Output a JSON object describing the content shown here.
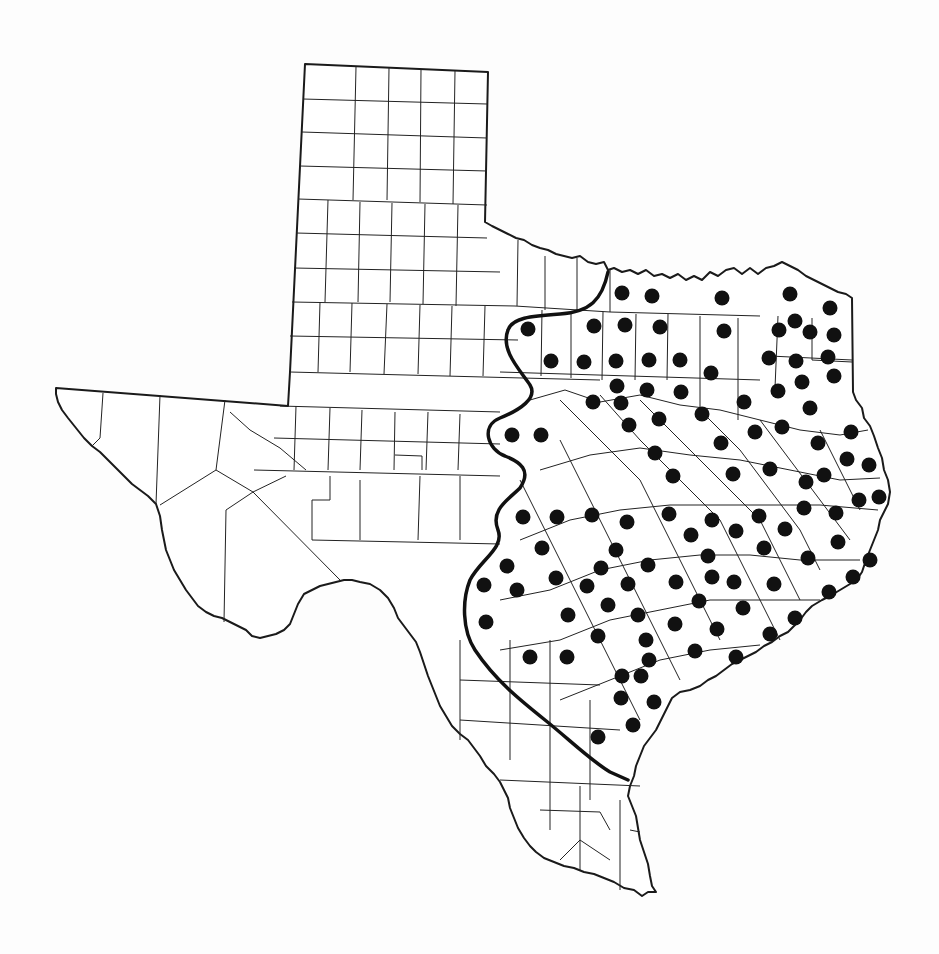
{
  "map": {
    "region": "Texas",
    "description": "County outline map of Texas with species occurrence dots and a range boundary line",
    "colors": {
      "background": "#ffffff",
      "outline": "#1a1a1a",
      "dot": "#111111",
      "boundary": "#111111"
    },
    "dot_radius": 7.5,
    "dots": [
      [
        622,
        293
      ],
      [
        652,
        296
      ],
      [
        722,
        298
      ],
      [
        790,
        294
      ],
      [
        830,
        308
      ],
      [
        528,
        329
      ],
      [
        594,
        326
      ],
      [
        625,
        325
      ],
      [
        660,
        327
      ],
      [
        724,
        331
      ],
      [
        779,
        330
      ],
      [
        795,
        321
      ],
      [
        810,
        332
      ],
      [
        834,
        335
      ],
      [
        551,
        361
      ],
      [
        584,
        362
      ],
      [
        616,
        361
      ],
      [
        649,
        360
      ],
      [
        680,
        360
      ],
      [
        711,
        373
      ],
      [
        769,
        358
      ],
      [
        796,
        361
      ],
      [
        828,
        357
      ],
      [
        834,
        376
      ],
      [
        617,
        386
      ],
      [
        647,
        390
      ],
      [
        681,
        392
      ],
      [
        593,
        402
      ],
      [
        621,
        403
      ],
      [
        744,
        402
      ],
      [
        778,
        391
      ],
      [
        802,
        382
      ],
      [
        810,
        408
      ],
      [
        512,
        435
      ],
      [
        541,
        435
      ],
      [
        629,
        425
      ],
      [
        659,
        419
      ],
      [
        702,
        414
      ],
      [
        755,
        432
      ],
      [
        782,
        427
      ],
      [
        818,
        443
      ],
      [
        851,
        432
      ],
      [
        655,
        453
      ],
      [
        721,
        443
      ],
      [
        770,
        469
      ],
      [
        847,
        459
      ],
      [
        869,
        465
      ],
      [
        673,
        476
      ],
      [
        733,
        474
      ],
      [
        806,
        482
      ],
      [
        824,
        475
      ],
      [
        859,
        500
      ],
      [
        879,
        497
      ],
      [
        523,
        517
      ],
      [
        557,
        517
      ],
      [
        592,
        515
      ],
      [
        627,
        522
      ],
      [
        669,
        514
      ],
      [
        712,
        520
      ],
      [
        736,
        531
      ],
      [
        759,
        516
      ],
      [
        785,
        529
      ],
      [
        804,
        508
      ],
      [
        836,
        513
      ],
      [
        542,
        548
      ],
      [
        616,
        550
      ],
      [
        648,
        565
      ],
      [
        691,
        535
      ],
      [
        708,
        556
      ],
      [
        764,
        548
      ],
      [
        808,
        558
      ],
      [
        838,
        542
      ],
      [
        507,
        566
      ],
      [
        484,
        585
      ],
      [
        517,
        590
      ],
      [
        556,
        578
      ],
      [
        587,
        586
      ],
      [
        601,
        568
      ],
      [
        628,
        584
      ],
      [
        676,
        582
      ],
      [
        712,
        577
      ],
      [
        734,
        582
      ],
      [
        774,
        584
      ],
      [
        829,
        592
      ],
      [
        853,
        577
      ],
      [
        870,
        560
      ],
      [
        486,
        622
      ],
      [
        568,
        615
      ],
      [
        608,
        605
      ],
      [
        638,
        615
      ],
      [
        699,
        601
      ],
      [
        743,
        608
      ],
      [
        795,
        618
      ],
      [
        530,
        657
      ],
      [
        567,
        657
      ],
      [
        598,
        636
      ],
      [
        646,
        640
      ],
      [
        675,
        624
      ],
      [
        717,
        629
      ],
      [
        770,
        634
      ],
      [
        622,
        676
      ],
      [
        649,
        660
      ],
      [
        695,
        651
      ],
      [
        736,
        657
      ],
      [
        641,
        676
      ],
      [
        621,
        698
      ],
      [
        654,
        702
      ],
      [
        633,
        725
      ],
      [
        598,
        737
      ]
    ],
    "boundary_label": "Range limit line"
  }
}
